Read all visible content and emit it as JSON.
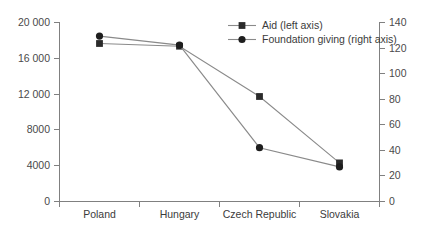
{
  "chart_data": {
    "type": "line",
    "title": "",
    "xlabel": "",
    "categories": [
      "Poland",
      "Hungary",
      "Czech Republic",
      "Slovakia"
    ],
    "series": [
      {
        "name": "Aid (left axis)",
        "axis": "left",
        "marker": "square",
        "color": "#2b2b2b",
        "values": [
          17600,
          17300,
          11700,
          4300
        ]
      },
      {
        "name": "Foundation giving (right axis)",
        "axis": "right",
        "marker": "circle",
        "color": "#1e1e1e",
        "values": [
          129,
          122,
          42,
          27
        ]
      }
    ],
    "left_axis": {
      "label": "",
      "ylim": [
        0,
        20000
      ],
      "ticks": [
        0,
        4000,
        8000,
        12000,
        16000,
        20000
      ],
      "tick_labels": [
        "0",
        "4000",
        "8000",
        "12 000",
        "16 000",
        "20 000"
      ]
    },
    "right_axis": {
      "label": "",
      "ylim": [
        0,
        140
      ],
      "ticks": [
        0,
        20,
        40,
        60,
        80,
        100,
        120,
        140
      ],
      "tick_labels": [
        "0",
        "20",
        "40",
        "60",
        "80",
        "100",
        "120",
        "140"
      ]
    },
    "legend": {
      "position": "top-center",
      "entries": [
        {
          "label": "Aid (left axis)",
          "marker": "square"
        },
        {
          "label": "Foundation giving (right axis)",
          "marker": "circle"
        }
      ]
    },
    "grid": false,
    "line_color": "#8a8a8a",
    "axis_color": "#808080"
  }
}
